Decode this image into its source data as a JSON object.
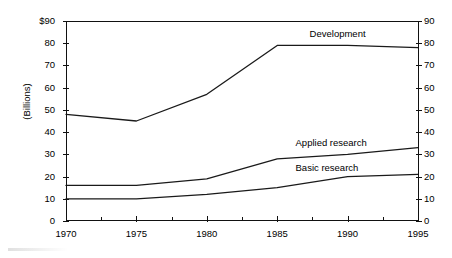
{
  "chart_data": {
    "type": "line",
    "title": "",
    "xlabel": "",
    "ylabel": "(Billions)",
    "x": [
      1970,
      1975,
      1980,
      1985,
      1990,
      1995
    ],
    "xlim": [
      1970,
      1995
    ],
    "ylim": [
      0,
      90
    ],
    "grid": false,
    "legend_position": "inline-annotations",
    "x_tick_labels": [
      "1970",
      "1975",
      "1980",
      "1985",
      "1990",
      "1995"
    ],
    "y_tick_labels_left": [
      "$90",
      "80",
      "70",
      "60",
      "50",
      "40",
      "30",
      "20",
      "10",
      "0"
    ],
    "y_tick_labels_right": [
      "90",
      "80",
      "70",
      "60",
      "50",
      "40",
      "30",
      "20",
      "10",
      "0"
    ],
    "y_tick_values": [
      90,
      80,
      70,
      60,
      50,
      40,
      30,
      20,
      10,
      0
    ],
    "series": [
      {
        "name": "Development",
        "values": [
          48,
          45,
          57,
          79,
          79,
          78
        ]
      },
      {
        "name": "Applied research",
        "values": [
          16,
          16,
          19,
          28,
          30,
          33
        ]
      },
      {
        "name": "Basic research",
        "values": [
          10,
          10,
          12,
          15,
          20,
          21
        ]
      }
    ],
    "annotations": [
      {
        "text": "Development",
        "x": 1990.0,
        "y": 84
      },
      {
        "text": "Applied research",
        "x": 1989.0,
        "y": 35
      },
      {
        "text": "Basic research",
        "x": 1989.0,
        "y": 24
      }
    ]
  }
}
